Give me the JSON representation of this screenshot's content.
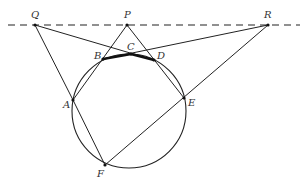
{
  "diagram": {
    "type": "geometry",
    "colors": {
      "stroke": "#222222",
      "label": "#333333",
      "background": "#ffffff"
    },
    "labels": {
      "Q": "Q",
      "P": "P",
      "R": "R",
      "A": "A",
      "B": "B",
      "C": "C",
      "D": "D",
      "E": "E",
      "F": "F"
    },
    "circle": {
      "cx": 129,
      "cy": 111,
      "r": 57
    },
    "points": {
      "Q": [
        35,
        25
      ],
      "P": [
        127,
        25
      ],
      "R": [
        268,
        25
      ],
      "A": [
        73,
        100
      ],
      "B": [
        103,
        59
      ],
      "C": [
        131,
        54
      ],
      "D": [
        154,
        60
      ],
      "E": [
        184,
        98
      ],
      "F": [
        105,
        165
      ]
    },
    "dashed_line": {
      "from": [
        8,
        25
      ],
      "to": [
        300,
        25
      ]
    },
    "segments": [
      [
        "Q",
        "A"
      ],
      [
        "Q",
        "D"
      ],
      [
        "R",
        "B"
      ],
      [
        "R",
        "F"
      ],
      [
        "P",
        "A"
      ],
      [
        "P",
        "E"
      ],
      [
        "A",
        "F"
      ]
    ],
    "bold_segments": [
      [
        "B",
        "C"
      ],
      [
        "C",
        "D"
      ]
    ]
  }
}
